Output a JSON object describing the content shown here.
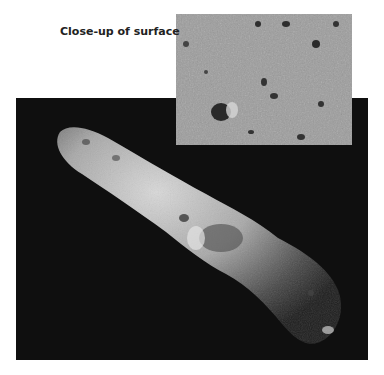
{
  "figure": {
    "inset_label": "Close-up of surface",
    "main_image": {
      "subject": "elongated-asteroid",
      "background": "#0f0f0f"
    },
    "inset_image": {
      "subject": "surface-closeup",
      "tone": "#9a9a9a"
    }
  }
}
